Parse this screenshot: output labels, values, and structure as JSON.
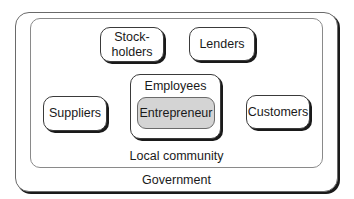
{
  "diagram": {
    "outer_frame": {
      "label": "Government"
    },
    "inner_frame": {
      "label": "Local community"
    },
    "stakeholders": {
      "stockholders": {
        "line1": "Stock-",
        "line2": "holders"
      },
      "lenders": {
        "label": "Lenders"
      },
      "suppliers": {
        "label": "Suppliers"
      },
      "customers": {
        "label": "Customers"
      },
      "employees": {
        "label": "Employees"
      },
      "entrepreneur": {
        "label": "Entrepreneur"
      }
    },
    "colors": {
      "entrepreneur_fill": "#d4d4d4",
      "box_fill": "#ffffff",
      "border": "#3a3a3a"
    }
  }
}
